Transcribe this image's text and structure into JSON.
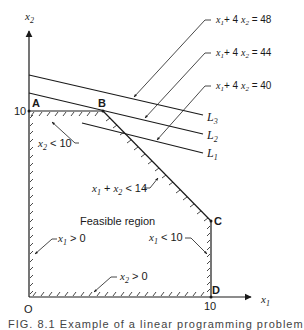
{
  "figure": {
    "axes": {
      "x_label": "x",
      "x_sub": "1",
      "y_label": "x",
      "y_sub": "2",
      "origin_label": "O",
      "x_tick": "10",
      "y_tick": "10"
    },
    "points": {
      "A": "A",
      "B": "B",
      "C": "C",
      "D": "D"
    },
    "region_label": "Feasible region",
    "constraints": [
      {
        "id": "x2_lt_10",
        "var": "x",
        "sub": "2",
        "rest": " < 10"
      },
      {
        "id": "sum_lt_14",
        "a": "x",
        "a_sub": "1",
        "mid": " + ",
        "b": "x",
        "b_sub": "2",
        "rest": " < 14"
      },
      {
        "id": "x1_gt_0",
        "var": "x",
        "sub": "1",
        "rest": " > 0"
      },
      {
        "id": "x1_lt_10",
        "var": "x",
        "sub": "1",
        "rest": " < 10"
      },
      {
        "id": "x2_gt_0",
        "var": "x",
        "sub": "2",
        "rest": " > 0"
      }
    ],
    "objective_lines": [
      {
        "name": "L",
        "sub": "3",
        "eq_a": "x",
        "eq_a_sub": "1",
        "eq_mid": "+ 4 ",
        "eq_b": "x",
        "eq_b_sub": "2",
        "eq_rhs": " = 48"
      },
      {
        "name": "L",
        "sub": "2",
        "eq_a": "x",
        "eq_a_sub": "1",
        "eq_mid": "+ 4 ",
        "eq_b": "x",
        "eq_b_sub": "2",
        "eq_rhs": " = 44"
      },
      {
        "name": "L",
        "sub": "1",
        "eq_a": "x",
        "eq_a_sub": "1",
        "eq_mid": "+ 4 ",
        "eq_b": "x",
        "eq_b_sub": "2",
        "eq_rhs": " = 40"
      }
    ],
    "caption": "FIG. 8.1   Example of a linear programming problem"
  }
}
